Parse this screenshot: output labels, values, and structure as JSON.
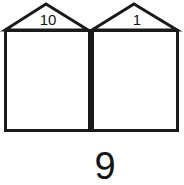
{
  "figure": {
    "kind": "place-value-house-diagram",
    "stroke_color": "#1a1a1a",
    "fill_color": "#ffffff",
    "text_color": "#151515"
  },
  "houses": [
    {
      "id": "left",
      "roof_label": "10",
      "body_label": ""
    },
    {
      "id": "right",
      "roof_label": "1",
      "body_label": ""
    }
  ],
  "sum": {
    "value": "9"
  }
}
